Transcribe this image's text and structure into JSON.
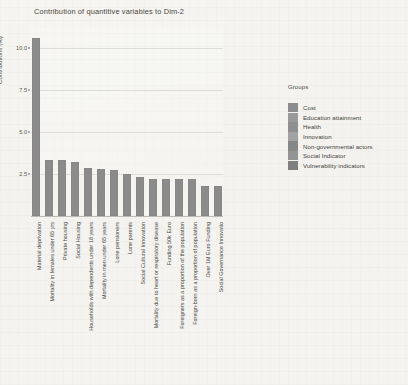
{
  "chart_data": {
    "type": "bar",
    "title": "Contribution of quantitive variables to Dim-2",
    "xlabel": "",
    "ylabel": "Contributions (%)",
    "ylim": [
      0,
      11.2
    ],
    "grid": true,
    "yticks": [
      "10.0",
      "7.5",
      "5.0",
      "2.5"
    ],
    "ytick_values": [
      10.0,
      7.5,
      5.0,
      2.5
    ],
    "legend_position": "right",
    "categories": [
      "Material deprivation",
      "Mortality in females under 65 yrs",
      "Private housing",
      "Social Housing",
      "Households with dependents under 18 years",
      "Mortality in men under 65 years",
      "Lone pensioners",
      "Lone parents",
      "Social Cultural Innovation",
      "Mortality due to heart or respiratory disease",
      "Funding 50k Euro",
      "Foreigners as a proportion of the population",
      "Foreign-born as a proportion of population",
      "Over 1M Euro Funding",
      "Social Governance Innovatio"
    ],
    "values": [
      10.6,
      3.35,
      3.35,
      3.2,
      2.85,
      2.8,
      2.75,
      2.5,
      2.35,
      2.2,
      2.2,
      2.2,
      2.2,
      1.8,
      1.8
    ],
    "bar_color": "#8b8b8b"
  },
  "legend": {
    "title": "Groups",
    "items": [
      {
        "label": "Cost",
        "color": "#8d8d8d"
      },
      {
        "label": "Education attainment",
        "color": "#9a9a9a"
      },
      {
        "label": "Health",
        "color": "#8f8f8f"
      },
      {
        "label": "Innovation",
        "color": "#a2a2a2"
      },
      {
        "label": "Non-governmental actors",
        "color": "#878787"
      },
      {
        "label": "Social Indicator",
        "color": "#949494"
      },
      {
        "label": "Vulnerability indicators",
        "color": "#7f7f7f"
      }
    ]
  }
}
